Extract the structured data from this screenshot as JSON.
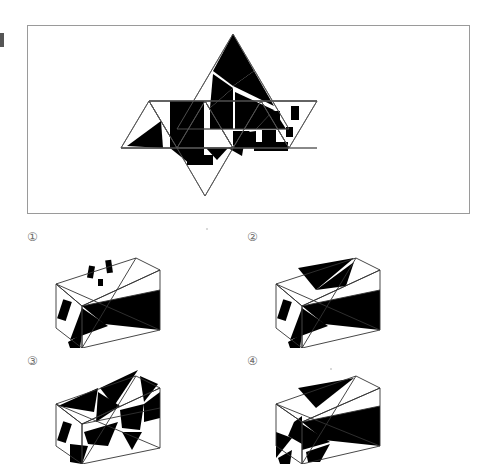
{
  "page": {
    "background_color": "#ffffff",
    "ink_color": "#000000",
    "line_color": "#555555",
    "panel_border_color": "#9a9a9a",
    "label_color": "#6f6f6f"
  },
  "main_panel": {
    "name": "net-panel",
    "caption": "",
    "figure_description": "Unfolded net of a solid made of equilateral triangles, each face patterned with black triangles or black rectangles",
    "faces": [
      {
        "id": "face-left-up",
        "kind": "triangle-up",
        "pattern": "black-triangle"
      },
      {
        "id": "face-left-down",
        "kind": "triangle-down",
        "pattern": "blank"
      },
      {
        "id": "face-center-left-up",
        "kind": "triangle-up",
        "pattern": "black-wedge"
      },
      {
        "id": "face-center-down",
        "kind": "triangle-down",
        "pattern": "black-triangles"
      },
      {
        "id": "face-top",
        "kind": "triangle-up",
        "pattern": "sierpinski-black"
      },
      {
        "id": "face-center-right-up",
        "kind": "triangle-up",
        "pattern": "black-stripes"
      },
      {
        "id": "face-right-down",
        "kind": "triangle-down",
        "pattern": "black-rectangles"
      },
      {
        "id": "face-right-up",
        "kind": "triangle-up",
        "pattern": "black-rectangles"
      },
      {
        "id": "face-bottom-down",
        "kind": "triangle-down",
        "pattern": "black-rectangle"
      }
    ]
  },
  "options": [
    {
      "id": "option-1",
      "label": "①",
      "figure_description": "Assembled solid drawn as a parallelogram seen in oblique view with small black rectangles on the upper-left face and large black triangles on the right"
    },
    {
      "id": "option-2",
      "label": "②",
      "figure_description": "Assembled solid with a black triangle on the top-left face, a small black rectangle on the left face, and large black triangles on the right"
    },
    {
      "id": "option-3",
      "label": "③",
      "figure_description": "Assembled solid densely covered with black triangles on the top and right faces and a small black rectangle on the left face"
    },
    {
      "id": "option-4",
      "label": "④",
      "figure_description": "Assembled solid with black triangles on the top face and right face and black wedges on the lower-left face"
    }
  ]
}
